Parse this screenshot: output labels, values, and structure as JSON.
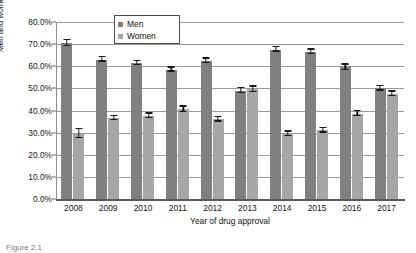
{
  "chart_data": {
    "type": "bar",
    "title": "",
    "xlabel": "Year of drug approval",
    "ylabel": "Men and women participants (%)",
    "categories": [
      "2008",
      "2009",
      "2010",
      "2011",
      "2012",
      "2013",
      "2014",
      "2015",
      "2016",
      "2017"
    ],
    "series": [
      {
        "name": "Men",
        "color": "#808080",
        "values": [
          70.5,
          63.0,
          61.5,
          58.5,
          62.5,
          49.0,
          67.5,
          66.5,
          59.5,
          50.0
        ],
        "errors": [
          1.3,
          1.0,
          0.9,
          0.9,
          1.0,
          1.1,
          1.0,
          1.0,
          1.2,
          1.0
        ]
      },
      {
        "name": "Women",
        "color": "#a6a6a6",
        "values": [
          29.5,
          36.5,
          37.5,
          40.5,
          36.0,
          49.5,
          29.5,
          31.0,
          38.5,
          47.5
        ],
        "errors": [
          2.0,
          1.0,
          1.1,
          1.2,
          1.1,
          1.2,
          1.0,
          1.1,
          1.2,
          1.0
        ]
      }
    ],
    "ylim": [
      0,
      80
    ],
    "ytick_labels": [
      "0.0%",
      "10.0%",
      "20.0%",
      "30.0%",
      "40.0%",
      "50.0%",
      "60.0%",
      "70.0%",
      "80.0%"
    ],
    "ytick_values": [
      0,
      10,
      20,
      30,
      40,
      50,
      60,
      70,
      80
    ],
    "grid": true,
    "legend_position": "top-center"
  },
  "legend": {
    "entries": [
      {
        "label": "Men",
        "color": "#808080"
      },
      {
        "label": "Women",
        "color": "#a6a6a6"
      }
    ]
  },
  "caption": {
    "text": "Figure 2.1"
  }
}
